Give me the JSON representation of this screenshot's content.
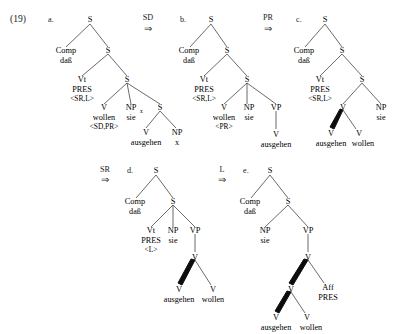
{
  "figure": {
    "example_number": "(19)",
    "width": 403,
    "height": 334,
    "arrows": [
      {
        "label": "SD",
        "glyph": "⇒"
      },
      {
        "label": "PR",
        "glyph": "⇒"
      },
      {
        "label": "SR",
        "glyph": "⇒"
      },
      {
        "label": "L",
        "glyph": "⇒"
      }
    ],
    "tree_letters": [
      "a.",
      "b.",
      "c.",
      "d.",
      "e."
    ],
    "labels": {
      "S": "S",
      "Comp": "Comp",
      "dass": "daß",
      "Vt": "Vt",
      "PRES": "PRES",
      "feat_SR_L": "<SR,L>",
      "feat_L": "<L>",
      "feat_SD_PR": "<SD,PR>",
      "feat_PR": "<PR>",
      "V": "V",
      "NP": "NP",
      "VP": "VP",
      "Aff": "Aff",
      "wollen": "wollen",
      "sie": "sie",
      "ausgehen": "ausgehen",
      "x": "x",
      "sub_x": "x"
    },
    "trees": {
      "a": {
        "letter": "a.",
        "nodes": [
          {
            "name": "root-s",
            "cat": "S"
          },
          {
            "name": "comp",
            "cat": "Comp",
            "word": "daß"
          },
          {
            "name": "s2",
            "cat": "S"
          },
          {
            "name": "vt",
            "cat": "Vt",
            "word": "PRES",
            "feature": "<SR,L>"
          },
          {
            "name": "s3",
            "cat": "S"
          },
          {
            "name": "v-wollen",
            "cat": "V",
            "word": "wollen",
            "feature": "<SD,PR>"
          },
          {
            "name": "np-sie",
            "cat": "NP",
            "sub": "x",
            "word": "sie"
          },
          {
            "name": "s4",
            "cat": "S"
          },
          {
            "name": "v-ausgehen",
            "cat": "V",
            "word": "ausgehen"
          },
          {
            "name": "np-x",
            "cat": "NP",
            "word": "x"
          }
        ]
      },
      "b": {
        "letter": "b.",
        "nodes": [
          {
            "name": "root-s",
            "cat": "S"
          },
          {
            "name": "comp",
            "cat": "Comp",
            "word": "daß"
          },
          {
            "name": "s2",
            "cat": "S"
          },
          {
            "name": "vt",
            "cat": "Vt",
            "word": "PRES",
            "feature": "<SR,L>"
          },
          {
            "name": "s3",
            "cat": "S"
          },
          {
            "name": "v-wollen",
            "cat": "V",
            "word": "wollen",
            "feature": "<PR>"
          },
          {
            "name": "np-sie",
            "cat": "NP",
            "word": "sie"
          },
          {
            "name": "vp",
            "cat": "VP"
          },
          {
            "name": "v-ausgehen",
            "cat": "V",
            "word": "ausgehen"
          }
        ]
      },
      "c": {
        "letter": "c.",
        "nodes": [
          {
            "name": "root-s",
            "cat": "S"
          },
          {
            "name": "comp",
            "cat": "Comp",
            "word": "daß"
          },
          {
            "name": "s2",
            "cat": "S"
          },
          {
            "name": "vt",
            "cat": "Vt",
            "word": "PRES",
            "feature": "<SR,L>"
          },
          {
            "name": "s3",
            "cat": "S"
          },
          {
            "name": "v-complex",
            "cat": "V"
          },
          {
            "name": "np-sie",
            "cat": "NP",
            "word": "sie"
          },
          {
            "name": "v-ausgehen",
            "cat": "V",
            "word": "ausgehen"
          },
          {
            "name": "v-wollen",
            "cat": "V",
            "word": "wollen"
          }
        ]
      },
      "d": {
        "letter": "d.",
        "nodes": [
          {
            "name": "root-s",
            "cat": "S"
          },
          {
            "name": "comp",
            "cat": "Comp",
            "word": "daß"
          },
          {
            "name": "s2",
            "cat": "S"
          },
          {
            "name": "vt",
            "cat": "Vt",
            "word": "PRES",
            "feature": "<L>"
          },
          {
            "name": "np-sie",
            "cat": "NP",
            "word": "sie"
          },
          {
            "name": "vp",
            "cat": "VP"
          },
          {
            "name": "v-complex",
            "cat": "V"
          },
          {
            "name": "v-ausgehen",
            "cat": "V",
            "word": "ausgehen"
          },
          {
            "name": "v-wollen",
            "cat": "V",
            "word": "wollen"
          }
        ]
      },
      "e": {
        "letter": "e.",
        "nodes": [
          {
            "name": "root-s",
            "cat": "S"
          },
          {
            "name": "comp",
            "cat": "Comp",
            "word": "daß"
          },
          {
            "name": "s2",
            "cat": "S"
          },
          {
            "name": "np-sie",
            "cat": "NP",
            "word": "sie"
          },
          {
            "name": "vp",
            "cat": "VP"
          },
          {
            "name": "v-top",
            "cat": "V"
          },
          {
            "name": "v-mid",
            "cat": "V"
          },
          {
            "name": "aff",
            "cat": "Aff",
            "word": "PRES"
          },
          {
            "name": "v-ausgehen",
            "cat": "V",
            "word": "ausgehen"
          },
          {
            "name": "v-wollen",
            "cat": "V",
            "word": "wollen"
          }
        ]
      }
    }
  }
}
